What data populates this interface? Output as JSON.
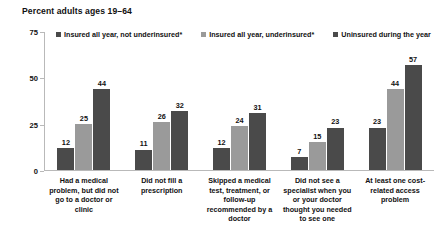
{
  "chart_data": {
    "type": "bar",
    "title": "Percent adults ages 19–64",
    "xlabel": "",
    "ylabel": "",
    "ylim": [
      0,
      75
    ],
    "yticks": [
      0,
      25,
      50,
      75
    ],
    "grid": false,
    "legend_position": "top",
    "categories": [
      "Had a medical problem, but did not go to a doctor or clinic",
      "Did not fill a prescription",
      "Skipped a medical test, treatment, or follow-up recommended by a doctor",
      "Did not see a specialist when you or your doctor thought you needed to see one",
      "At least one cost-related access problem"
    ],
    "series": [
      {
        "name": "Insured all year, not underinsured*",
        "color": "#4a4a4a",
        "values": [
          12,
          11,
          12,
          7,
          23
        ]
      },
      {
        "name": "Insured all year, underinsured*",
        "color": "#9a9a9a",
        "values": [
          25,
          26,
          24,
          15,
          44
        ]
      },
      {
        "name": "Uninsured during the year",
        "color": "#4a4a4a",
        "values": [
          44,
          32,
          31,
          23,
          57
        ]
      }
    ]
  },
  "axis": {
    "tick_0": "0",
    "tick_1": "25",
    "tick_2": "50",
    "tick_3": "75"
  },
  "colors": {
    "series_dark": "#4a4a4a",
    "series_medium": "#9a9a9a",
    "axis": "#b9b9b9",
    "text": "#111111",
    "background": "#ffffff"
  }
}
